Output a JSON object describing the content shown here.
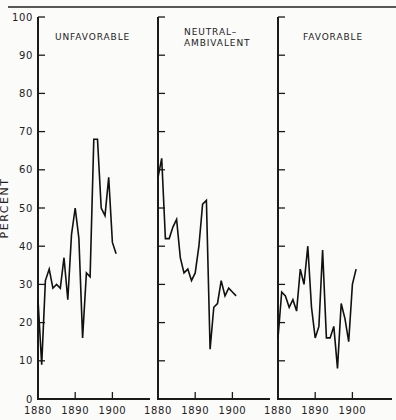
{
  "chart_data": {
    "type": "line",
    "layout": "three side-by-side panels sharing a y-axis scale",
    "ylabel": "PERCENT",
    "ylim": [
      0,
      100
    ],
    "yticks": [
      0,
      10,
      20,
      30,
      40,
      50,
      60,
      70,
      80,
      90,
      100
    ],
    "xlim": [
      1880,
      1902
    ],
    "xticks": [
      1880,
      1890,
      1900
    ],
    "grid": false,
    "legend": "none (each panel titled)",
    "panels": [
      {
        "title": "UNFAVORABLE",
        "x": [
          1880,
          1881,
          1882,
          1883,
          1884,
          1885,
          1886,
          1887,
          1888,
          1889,
          1890,
          1891,
          1892,
          1893,
          1894,
          1895,
          1896,
          1897,
          1898,
          1899,
          1900,
          1901
        ],
        "values": [
          26,
          9,
          31,
          34,
          29,
          30,
          29,
          37,
          26,
          43,
          50,
          42,
          16,
          33,
          32,
          68,
          68,
          50,
          48,
          58,
          41,
          38
        ]
      },
      {
        "title": "NEUTRAL– AMBIVALENT",
        "title_lines": [
          "NEUTRAL–",
          "AMBIVALENT"
        ],
        "x": [
          1880,
          1881,
          1882,
          1883,
          1884,
          1885,
          1886,
          1887,
          1888,
          1889,
          1890,
          1891,
          1892,
          1893,
          1894,
          1895,
          1896,
          1897,
          1898,
          1899,
          1900,
          1901
        ],
        "values": [
          58,
          63,
          42,
          42,
          45,
          47,
          37,
          33,
          34,
          31,
          33,
          40,
          51,
          52,
          13,
          24,
          25,
          31,
          27,
          29,
          28,
          27
        ]
      },
      {
        "title": "FAVORABLE",
        "x": [
          1880,
          1881,
          1882,
          1883,
          1884,
          1885,
          1886,
          1887,
          1888,
          1889,
          1890,
          1891,
          1892,
          1893,
          1894,
          1895,
          1896,
          1897,
          1898,
          1899,
          1900,
          1901
        ],
        "values": [
          16,
          28,
          27,
          24,
          26,
          23,
          34,
          30,
          40,
          24,
          16,
          19,
          39,
          16,
          16,
          19,
          8,
          25,
          21,
          15,
          30,
          34
        ]
      }
    ]
  },
  "labels": {
    "ylabel": "PERCENT",
    "yticks": [
      "0",
      "10",
      "20",
      "30",
      "40",
      "50",
      "60",
      "70",
      "80",
      "90",
      "100"
    ],
    "xticks": [
      "1880",
      "1890",
      "1900"
    ],
    "panel1_title": "UNFAVORABLE",
    "panel2_title_line1": "NEUTRAL–",
    "panel2_title_line2": "AMBIVALENT",
    "panel3_title": "FAVORABLE"
  }
}
